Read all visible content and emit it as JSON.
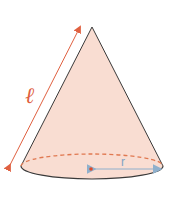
{
  "diagram": {
    "type": "cone",
    "labels": {
      "slant_height": "ℓ",
      "radius": "r"
    },
    "colors": {
      "fill": "#f9ddd2",
      "outline": "#3a3a3a",
      "slant_arrow": "#e06040",
      "hidden_edge": "#e07850",
      "radius_arrow": "#8fb0cc",
      "center_point": "#e04a2a",
      "label_l": "#e06040",
      "label_r": "#7fa3c2"
    }
  }
}
